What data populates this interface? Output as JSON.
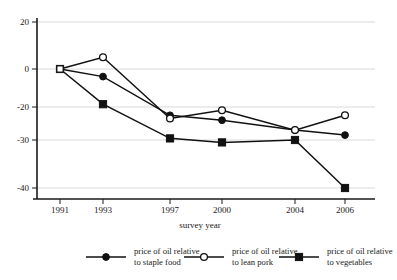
{
  "chart_data": {
    "type": "line",
    "title": "",
    "xlabel": "survey year",
    "ylabel": "",
    "categories": [
      "1991",
      "1993",
      "1997",
      "2000",
      "2004",
      "2006"
    ],
    "x": [
      1991,
      1993,
      1997,
      2000,
      2004,
      2006
    ],
    "ylim": [
      -40,
      20
    ],
    "yticks": [
      20,
      0,
      -20,
      -30,
      -40
    ],
    "ytick_labels": [
      "20",
      "0",
      "-20",
      "-30",
      "-40"
    ],
    "xtick_labels": [
      "1991",
      "1993",
      "1997",
      "2000",
      "2004",
      "2006"
    ],
    "grid": true,
    "legend_position": "bottom",
    "series": [
      {
        "name": "price of oil relative to staple food",
        "marker": "filled-circle",
        "values": [
          0,
          -4,
          -22.5,
          -24,
          -27,
          -28.5
        ]
      },
      {
        "name": "price of oil relative to lean pork",
        "marker": "open-circle",
        "values": [
          0,
          5,
          -23.5,
          -21,
          -27,
          -22.5
        ]
      },
      {
        "name": "price of oil relative to vegetables",
        "marker": "filled-square",
        "values": [
          0,
          -18.5,
          -29.5,
          -30.5,
          -30,
          -40
        ]
      }
    ]
  },
  "axes": {
    "y_tick_20": "20",
    "y_tick_0": "0",
    "y_tick_neg20": "-20",
    "y_tick_neg30": "-30",
    "y_tick_neg40": "-40",
    "x_tick_1991": "1991",
    "x_tick_1993": "1993",
    "x_tick_1997": "1997",
    "x_tick_2000": "2000",
    "x_tick_2004": "2004",
    "x_tick_2006": "2006",
    "x_axis_title": "survey year"
  },
  "legend": {
    "entries": [
      {
        "line1": "price of oil relative",
        "line2": "to staple food",
        "marker": "filled-circle"
      },
      {
        "line1": "price of oil relative",
        "line2": "to lean pork",
        "marker": "open-circle"
      },
      {
        "line1": "price of oil relative",
        "line2": "to vegetables",
        "marker": "filled-square"
      }
    ]
  },
  "colors": {
    "ink": "#111111",
    "grid": "#c9c9c9",
    "background": "#ffffff"
  }
}
